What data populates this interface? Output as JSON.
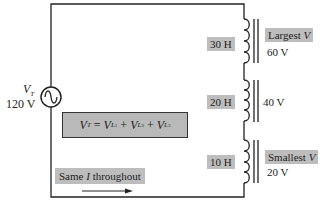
{
  "source": {
    "symbol": "V",
    "subscript": "T",
    "value": "120 V",
    "icon": "ac-source-icon"
  },
  "inductors": [
    {
      "label": "30 H",
      "voltage": "60 V",
      "note_prefix": "Largest ",
      "note_var": "V"
    },
    {
      "label": "20 H",
      "voltage": "40 V"
    },
    {
      "label": "10 H",
      "voltage": "20 V",
      "note_prefix": "Smallest ",
      "note_var": "V"
    }
  ],
  "equation": {
    "lhs": "V",
    "lhs_sub": "T",
    "eq": " = ",
    "terms": [
      {
        "var": "V",
        "sub": "L",
        "subsub": "1"
      },
      {
        "var": "V",
        "sub": "L",
        "subsub": "2"
      },
      {
        "var": "V",
        "sub": "L",
        "subsub": "3"
      }
    ],
    "plus": " + "
  },
  "current_note": {
    "prefix": "Same ",
    "var": "I",
    "suffix": " throughout",
    "icon": "current-direction-arrow-icon"
  },
  "colors": {
    "wire": "#222222",
    "label_fill": "#bdbdbd",
    "equation_fill": "#b9b9b9"
  }
}
